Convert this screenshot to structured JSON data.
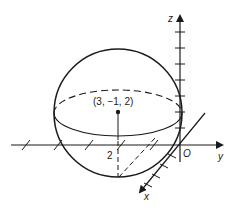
{
  "figure": {
    "center_label": "(3, −1, 2)",
    "height_label": "2",
    "origin_label": "O",
    "axes": {
      "x_label": "x",
      "y_label": "y",
      "z_label": "z"
    },
    "colors": {
      "ink": "#1a1a1a",
      "background": "#ffffff"
    }
  }
}
